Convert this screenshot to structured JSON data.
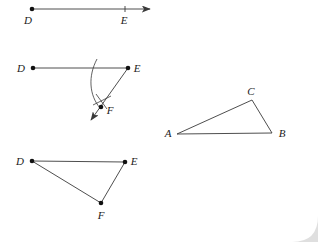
{
  "page": {
    "background_color": "#ffffff",
    "card_shadow_color": "#d8d8d8",
    "stroke_color": "#3a3a3a",
    "label_color": "#1b1b1b",
    "width": 318,
    "height": 242
  },
  "figures": [
    {
      "id": "ray-de",
      "caption": "Step 1: ray D to E with arrow",
      "points": [
        {
          "label": "D",
          "x": 32,
          "y": 9,
          "dot": true,
          "label_x": 28,
          "label_y": 24
        },
        {
          "label": "E",
          "x": 125,
          "y": 9,
          "dot": false,
          "label_x": 121,
          "label_y": 24
        }
      ],
      "segments": [
        {
          "name": "segment-d-e-arrow",
          "x1": 32,
          "y1": 9,
          "x2": 150,
          "y2": 9,
          "arrow": true
        }
      ],
      "ticks": [
        {
          "name": "tick-at-e",
          "x": 125,
          "y": 9,
          "height": 6
        }
      ]
    },
    {
      "id": "angle-def",
      "caption": "Step 2: compass arc from E, ray E to F with arrow",
      "points": [
        {
          "label": "D",
          "x": 33,
          "y": 68,
          "dot": true,
          "label_x": 20,
          "label_y": 72
        },
        {
          "label": "E",
          "x": 128,
          "y": 68,
          "dot": true,
          "label_x": 134,
          "label_y": 72
        },
        {
          "label": "F",
          "x": 101,
          "y": 107,
          "dot": true,
          "label_x": 107,
          "label_y": 113
        }
      ],
      "segments": [
        {
          "name": "segment-d-e",
          "x1": 33,
          "y1": 68,
          "x2": 128,
          "y2": 68,
          "arrow": false
        },
        {
          "name": "ray-e-f-arrow",
          "x1": 128,
          "y1": 68,
          "x2": 91,
          "y2": 120,
          "arrow": true
        }
      ],
      "arcs": [
        {
          "name": "compass-arc-from-e",
          "d": "M 96 61 C 88 78 89 95 99 106",
          "radius_hint": 44
        }
      ],
      "cross_marks": [
        {
          "name": "arc-intersection-mark-1",
          "x1": 92,
          "y1": 104,
          "x2": 110,
          "y2": 97
        },
        {
          "name": "arc-intersection-mark-2",
          "x1": 95,
          "y1": 94,
          "x2": 106,
          "y2": 108
        }
      ]
    },
    {
      "id": "triangle-def",
      "caption": "Step 3: triangle D E F",
      "points": [
        {
          "label": "D",
          "x": 32,
          "y": 161,
          "dot": true,
          "label_x": 18,
          "label_y": 164
        },
        {
          "label": "E",
          "x": 125,
          "y": 162,
          "dot": true,
          "label_x": 131,
          "label_y": 165
        },
        {
          "label": "F",
          "x": 101,
          "y": 203,
          "dot": true,
          "label_x": 98,
          "label_y": 218
        }
      ],
      "segments": [
        {
          "name": "segment-d-e",
          "x1": 32,
          "y1": 161,
          "x2": 125,
          "y2": 162,
          "arrow": false
        },
        {
          "name": "segment-e-f",
          "x1": 125,
          "y1": 162,
          "x2": 101,
          "y2": 203,
          "arrow": false
        },
        {
          "name": "segment-f-d",
          "x1": 101,
          "y1": 203,
          "x2": 32,
          "y2": 161,
          "arrow": false
        }
      ]
    },
    {
      "id": "triangle-abc",
      "caption": "Reference triangle A B C",
      "points": [
        {
          "label": "A",
          "x": 177,
          "y": 134,
          "dot": false,
          "label_x": 166,
          "label_y": 137
        },
        {
          "label": "B",
          "x": 272,
          "y": 133,
          "dot": false,
          "label_x": 279,
          "label_y": 137
        },
        {
          "label": "C",
          "x": 252,
          "y": 100,
          "dot": false,
          "label_x": 248,
          "label_y": 95
        }
      ],
      "segments": [
        {
          "name": "segment-a-b",
          "x1": 177,
          "y1": 134,
          "x2": 272,
          "y2": 133,
          "arrow": false
        },
        {
          "name": "segment-a-c",
          "x1": 177,
          "y1": 134,
          "x2": 252,
          "y2": 100,
          "arrow": false
        },
        {
          "name": "segment-c-b",
          "x1": 252,
          "y1": 100,
          "x2": 272,
          "y2": 133,
          "arrow": false
        }
      ]
    }
  ]
}
